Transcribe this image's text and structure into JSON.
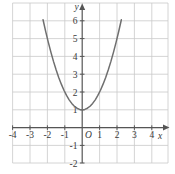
{
  "chart_data": {
    "type": "line",
    "title": "",
    "subtitle": "",
    "xlabel": "x",
    "ylabel": "y",
    "xlim": [
      -4.6,
      4.9
    ],
    "ylim": [
      -2.4,
      6.8
    ],
    "grid": true,
    "legend": null,
    "equation": "y = x^2 + 1",
    "vertex": [
      0,
      1
    ],
    "x_ticks": [
      -4,
      -3,
      -2,
      -1,
      1,
      2,
      3,
      4
    ],
    "x_tick_labels": [
      "-4",
      "-3",
      "-2",
      "-1",
      "1",
      "2",
      "3",
      "4"
    ],
    "y_ticks": [
      -2,
      -1,
      1,
      2,
      3,
      4,
      5,
      6
    ],
    "y_tick_labels": [
      "-2",
      "-1",
      "1",
      "2",
      "3",
      "4",
      "5",
      "6"
    ],
    "origin_label": "O",
    "series": [
      {
        "name": "parabola",
        "color": "#6f6f6f",
        "x": [
          -2.25,
          -2.1,
          -1.95,
          -1.8,
          -1.65,
          -1.5,
          -1.35,
          -1.2,
          -1.05,
          -0.9,
          -0.75,
          -0.6,
          -0.45,
          -0.3,
          -0.15,
          0,
          0.15,
          0.3,
          0.45,
          0.6,
          0.75,
          0.9,
          1.05,
          1.2,
          1.35,
          1.5,
          1.65,
          1.8,
          1.95,
          2.1,
          2.25
        ],
        "y": [
          6.06,
          5.41,
          4.8,
          4.24,
          3.72,
          3.25,
          2.82,
          2.44,
          2.1,
          1.81,
          1.56,
          1.36,
          1.2,
          1.09,
          1.02,
          1,
          1.02,
          1.09,
          1.2,
          1.36,
          1.56,
          1.81,
          2.1,
          2.44,
          2.82,
          3.25,
          3.72,
          4.24,
          4.8,
          5.41,
          6.06
        ]
      }
    ]
  },
  "style": {
    "grid_color": "#c9c9c9",
    "axis_color": "#555555",
    "curve_color": "#6f6f6f",
    "text_color": "#3a3a3a",
    "background": "#ffffff"
  }
}
